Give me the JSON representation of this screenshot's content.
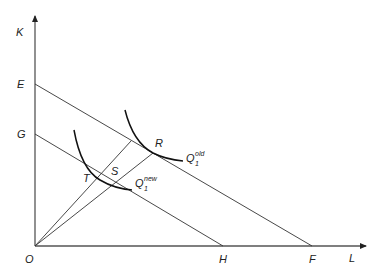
{
  "diagram": {
    "axes": {
      "y_label": "K",
      "x_label": "L",
      "origin_label": "O"
    },
    "intercepts": {
      "E": "E",
      "G": "G",
      "H": "H",
      "F": "F"
    },
    "points": {
      "R": "R",
      "S": "S",
      "T": "T"
    },
    "isoquants": [
      {
        "base": "Q",
        "sub": "1",
        "sup": "old"
      },
      {
        "base": "Q",
        "sub": "1",
        "sup": "new"
      }
    ]
  }
}
